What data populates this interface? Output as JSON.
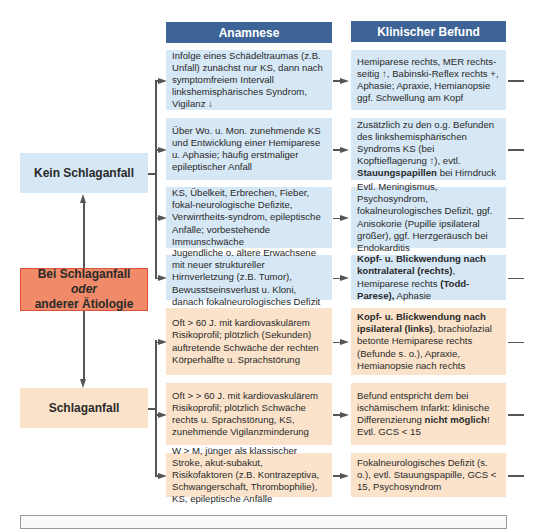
{
  "headers": {
    "anamnese": "Anamnese",
    "befund": "Klinischer Befund"
  },
  "left": {
    "kein": "Kein Schlaganfall",
    "center_line1": "Bei Schlaganfall",
    "center_line2": "oder",
    "center_line3": "anderer Ätiologie",
    "schlaganfall": "Schlaganfall"
  },
  "rows": [
    {
      "group": "kein",
      "anamnese": "Infolge eines Schädeltraumas (z.B. Unfall) zunächst nur KS, dann nach symptomfreiem Intervall linkshemisphärisches Syndrom, Vigilanz ↓",
      "befund_pre": "Hemiparese rechts, MER rechts-seitig ↑, Babinski-Reflex rechts +, Aphasie; Apraxie, Hemianopsie ggf. Schwellung am Kopf",
      "befund_bold": "",
      "befund_post": ""
    },
    {
      "group": "kein",
      "anamnese": "Über Wo. u. Mon. zunehmende KS und Entwicklung einer Hemiparese u. Aphasie; häufig erstmaliger epileptischer Anfall",
      "befund_pre": "Zusätzlich zu den o.g. Befunden des linkshemisphärischen Syndroms KS (bei Kopftieflagerung ↑), evtl. ",
      "befund_bold": "Stauungspapillen",
      "befund_post": " bei Hirndruck"
    },
    {
      "group": "kein",
      "anamnese": "KS, Übelkeit, Erbrechen, Fieber, fokal-neurologische Defizite, Verwirrtheits-syndrom, epileptische Anfälle; vorbestehende Immunschwäche",
      "befund_pre": "Evtl. Meningismus, Psychosyndrom, fokalneurologisches Defizit, ggf. Anisokorie (Pupille ipsilateral größer), ggf. Herzgeräusch bei Endokarditis",
      "befund_bold": "",
      "befund_post": ""
    },
    {
      "group": "kein",
      "anamnese": "Jugendliche o. ältere Erwachsene mit neuer struktureller Hirnverletzung (z.B. Tumor), Bewusstseinsverlust u. Kloni, danach fokalneurologisches Defizit",
      "befund_bold1": "Kopf- u. Blickwendung nach kontralateral (rechts)",
      "befund_mid": ", Hemiparese rechts ",
      "befund_bold2": "(Todd-Parese),",
      "befund_end": " Aphasie"
    },
    {
      "group": "schlaganfall",
      "anamnese": "Oft > 60 J. mit kardiovaskulärem Risikoprofil; plötzlich (Sekunden) auftretende Schwäche der rechten Körperhälfte u. Sprachstörung",
      "befund_bold": "Kopf- u. Blickwendung nach ipsilateral (links)",
      "befund_post": ", brachiofazial betonte Hemiparese rechts (Befunde s. o.), Apraxie, Hemianopsie nach rechts"
    },
    {
      "group": "schlaganfall",
      "anamnese": "Oft > > 60 J. mit kardiovaskulärem Risikoprofil; plötzlich Schwäche rechts u. Sprachstörung, KS, zunehmende Vigilanzminderung",
      "befund_pre": "Befund entspricht dem bei ischämischem Infarkt: klinische Differenzierung ",
      "befund_bold": "nicht möglich",
      "befund_post": "! Evtl. GCS < 15"
    },
    {
      "group": "schlaganfall",
      "anamnese": "W > M, jünger als klassischer Stroke, akut-subakut, Risikofaktoren (z.B. Kontrazeptiva, Schwangerschaft, Thrombophilie), KS, epileptische Anfälle",
      "befund_pre": "Fokalneurologisches Defizit (s. o.), evtl. Stauungspapille, GCS < 15, Psychosyndrom",
      "befund_bold": "",
      "befund_post": ""
    }
  ],
  "colors": {
    "header": "#3d6397",
    "blue": "#d6e7f5",
    "peach": "#fbe3cb",
    "red": "#f08a68",
    "line": "#555555"
  }
}
